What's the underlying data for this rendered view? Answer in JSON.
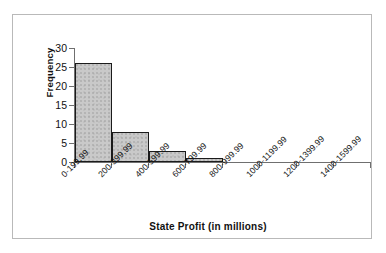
{
  "chart_data": {
    "type": "bar",
    "title": "",
    "subtitle": "",
    "xlabel": "State Profit (in millions)",
    "ylabel": "Frequency",
    "categories": [
      "0-199.99",
      "200-399.99",
      "400-599.99",
      "600-799.99",
      "800-999.99",
      "1000-1199.99",
      "1200-1399.99",
      "1400-1599.99"
    ],
    "values": [
      26,
      8,
      3,
      1,
      0,
      0,
      0,
      0
    ],
    "ylim": [
      0,
      30
    ],
    "y_ticks": [
      0,
      5,
      10,
      15,
      20,
      25,
      30
    ],
    "y_tick_labels": [
      "0",
      "5",
      "10",
      "15",
      "20",
      "25",
      "30"
    ],
    "grid": false,
    "legend": false,
    "legend_position": "none",
    "bar_fill_color": "#c9c9c9",
    "bar_edge_color": "#1b1b1b",
    "axis_color": "#6f6f6f",
    "frame_color": "#b9b9b9",
    "text_color": "#111111",
    "background_color": "#ffffff"
  }
}
